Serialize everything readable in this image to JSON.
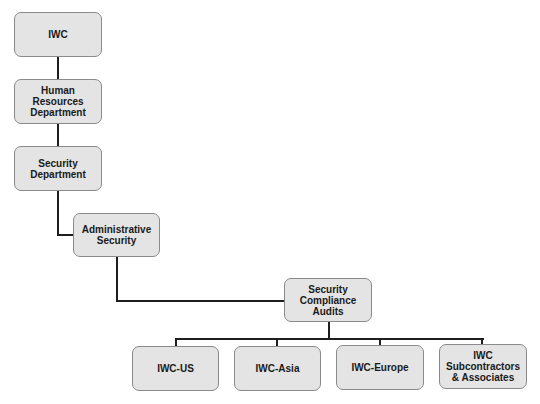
{
  "diagram": {
    "type": "org-chart",
    "colors": {
      "node_fill": "#e4e4e4",
      "node_border": "#8a8a8a",
      "connector": "#1e1e1e",
      "text": "#1a1a1a"
    },
    "nodes": [
      {
        "id": "iwc",
        "label": "IWC",
        "x": 14,
        "y": 12,
        "w": 88,
        "h": 45
      },
      {
        "id": "hr",
        "label": "Human Resources\nDepartment",
        "x": 14,
        "y": 79,
        "w": 88,
        "h": 45
      },
      {
        "id": "secdept",
        "label": "Security\nDepartment",
        "x": 14,
        "y": 146,
        "w": 88,
        "h": 45
      },
      {
        "id": "admin",
        "label": "Administrative\nSecurity",
        "x": 73,
        "y": 213,
        "w": 87,
        "h": 44
      },
      {
        "id": "sca",
        "label": "Security\nCompliance\nAudits",
        "x": 284,
        "y": 278,
        "w": 88,
        "h": 44
      },
      {
        "id": "us",
        "label": "IWC-US",
        "x": 132,
        "y": 346,
        "w": 87,
        "h": 45
      },
      {
        "id": "asia",
        "label": "IWC-Asia",
        "x": 234,
        "y": 346,
        "w": 87,
        "h": 45
      },
      {
        "id": "europe",
        "label": "IWC-Europe",
        "x": 336,
        "y": 345,
        "w": 88,
        "h": 45
      },
      {
        "id": "subs",
        "label": "IWC\nSubcontractors\n& Associates",
        "x": 439,
        "y": 344,
        "w": 88,
        "h": 45
      }
    ],
    "edges": [
      {
        "from": "iwc",
        "to": "hr"
      },
      {
        "from": "hr",
        "to": "secdept"
      },
      {
        "from": "secdept",
        "to": "admin"
      },
      {
        "from": "admin",
        "to": "sca"
      },
      {
        "from": "sca",
        "to": "us"
      },
      {
        "from": "sca",
        "to": "asia"
      },
      {
        "from": "sca",
        "to": "europe"
      },
      {
        "from": "sca",
        "to": "subs"
      }
    ]
  }
}
